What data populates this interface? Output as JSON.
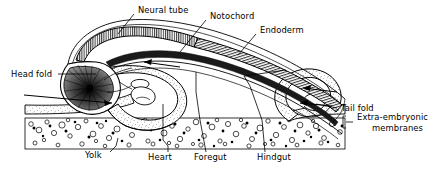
{
  "figure": {
    "background_color": "#ffffff",
    "line_color": "#000000",
    "width": 435,
    "height": 172
  },
  "labels": {
    "neural_tube": "Neural tube",
    "notochord": "Notochord",
    "endoderm": "Endoderm",
    "head_fold": "Head fold",
    "tail_fold": "Tail fold",
    "extra_embryonic_1": "Extra-embryonic",
    "extra_embryonic_2": "membranes",
    "yolk": "Yolk",
    "heart": "Heart",
    "foregut": "Foregut",
    "hindgut": "Hindgut"
  },
  "regions": [
    {
      "name": "neural-tube",
      "style": "dense-vertical-hatch",
      "position": "dorsal anterior"
    },
    {
      "name": "notochord",
      "style": "solid-dark-band",
      "position": "dorsal mid"
    },
    {
      "name": "endoderm",
      "style": "fine-hatched-band",
      "position": "dorsal posterior"
    },
    {
      "name": "head-fold",
      "style": "stipple",
      "position": "anterior ventral"
    },
    {
      "name": "tail-fold",
      "style": "stipple",
      "position": "posterior ventral"
    },
    {
      "name": "yolk",
      "style": "open-circles-and-dots",
      "position": "ventral band"
    },
    {
      "name": "extra-embryonic-membranes",
      "style": "stipple-strip",
      "position": "ventral lateral"
    }
  ],
  "arrows": [
    {
      "name": "head-fold-growth-arrow",
      "direction": "right",
      "note": "anterior fold extending posteriorly"
    },
    {
      "name": "foregut-arrow",
      "direction": "left",
      "note": "arrow into foregut pocket"
    },
    {
      "name": "tail-fold-growth-arrow",
      "direction": "left",
      "note": "posterior fold extending anteriorly"
    },
    {
      "name": "hindgut-arrow",
      "direction": "left",
      "note": "arrow into hindgut pocket"
    }
  ]
}
